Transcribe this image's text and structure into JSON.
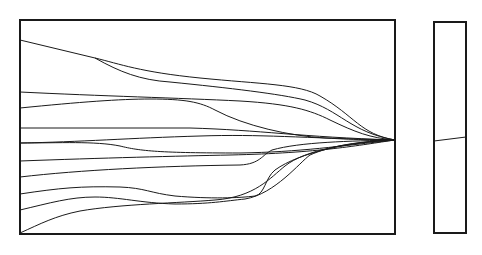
{
  "diagram": {
    "stroke_color": "#1a1a1a",
    "background": "#ffffff",
    "main_panel": {
      "x": 20,
      "y": 20,
      "width": 375,
      "height": 214,
      "border_width": 2,
      "converge_point": [
        395,
        140
      ],
      "curves": [
        {
          "d": "M20,40 L95,58 C120,64 140,72 200,78 C260,84 300,84 320,96 C355,116 360,134 395,140"
        },
        {
          "d": "M95,58 C120,72 140,80 170,82 C230,88 280,94 305,100 C340,110 350,132 395,140"
        },
        {
          "d": "M20,92 C100,96 180,98 240,101 C290,104 310,110 330,120 C355,132 370,138 395,140"
        },
        {
          "d": "M20,108 C80,102 120,99 150,99 C185,99 200,102 215,110 C245,126 290,136 325,138 C360,140 380,140 395,140"
        },
        {
          "d": "M20,128 L190,128 C260,130 300,137 395,140"
        },
        {
          "d": "M20,143 C60,143 95,141 120,146 C140,151 160,153 240,153 C300,152 340,146 395,140"
        },
        {
          "d": "M20,143 C80,142 130,138 200,136 C260,134 300,138 395,140"
        },
        {
          "d": "M20,161 C100,158 180,156 230,155 C320,153 360,145 395,140"
        },
        {
          "d": "M20,177 C80,170 160,166 240,165 C260,164 262,155 272,150 C300,142 350,141 395,140"
        },
        {
          "d": "M20,194 C60,188 80,186 120,187 C145,188 150,193 175,196 C210,199 240,198 255,196 C265,194 265,178 275,170 C300,152 350,142 395,140"
        },
        {
          "d": "M20,210 C50,203 70,197 95,197 C120,197 140,203 175,204 C210,204 225,201 245,199 C275,194 300,162 310,155 C330,146 360,141 395,140"
        },
        {
          "d": "M20,233 C40,224 55,216 80,211 C120,204 180,203 215,200 C255,197 270,178 285,166 C305,150 350,142 395,140"
        }
      ]
    },
    "side_panel": {
      "x": 434,
      "y": 22,
      "width": 32,
      "height": 211,
      "border_width": 2,
      "divider": {
        "x1": 434,
        "y1": 141,
        "x2": 466,
        "y2": 137
      }
    }
  }
}
